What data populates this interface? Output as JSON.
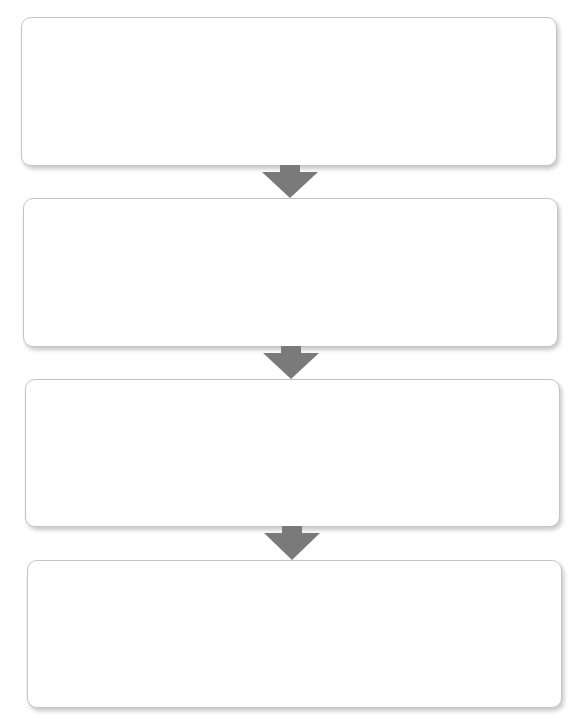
{
  "diagram": {
    "type": "vertical-flowchart",
    "steps": [
      {
        "label": "",
        "box": {
          "left": 21,
          "top": 17,
          "width": 536,
          "height": 149
        }
      },
      {
        "label": "",
        "box": {
          "left": 23,
          "top": 198,
          "width": 535,
          "height": 149
        }
      },
      {
        "label": "",
        "box": {
          "left": 25,
          "top": 379,
          "width": 535,
          "height": 148
        }
      },
      {
        "label": "",
        "box": {
          "left": 27,
          "top": 560,
          "width": 535,
          "height": 148
        }
      }
    ],
    "arrows": [
      {
        "from": 0,
        "to": 1,
        "direction": "down"
      },
      {
        "from": 1,
        "to": 2,
        "direction": "down"
      },
      {
        "from": 2,
        "to": 3,
        "direction": "down"
      }
    ],
    "colors": {
      "box_fill": "#ffffff",
      "box_border": "#c4c4c4",
      "arrow_fill": "#7a7a7a",
      "background": "#ffffff"
    }
  }
}
